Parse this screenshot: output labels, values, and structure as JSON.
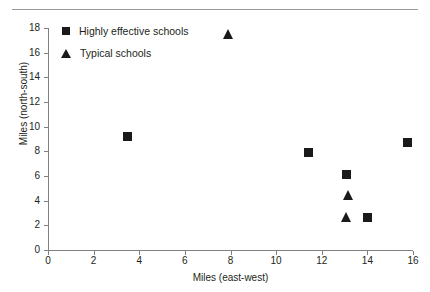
{
  "chart_data": {
    "type": "scatter",
    "title": "",
    "xlabel": "Miles (east-west)",
    "ylabel": "Miles (north-south)",
    "xlim": [
      0,
      16
    ],
    "ylim": [
      0,
      18
    ],
    "xticks": [
      0,
      2,
      4,
      6,
      8,
      10,
      12,
      14,
      16
    ],
    "yticks": [
      0,
      2,
      4,
      6,
      8,
      10,
      12,
      14,
      16,
      18
    ],
    "grid": false,
    "legend_position": "top-left",
    "series": [
      {
        "name": "Highly effective schools",
        "marker": "square",
        "color": "#1a1a1a",
        "points": [
          {
            "x": 3.5,
            "y": 9.2
          },
          {
            "x": 11.4,
            "y": 7.9
          },
          {
            "x": 15.75,
            "y": 8.7
          },
          {
            "x": 13.1,
            "y": 6.15
          },
          {
            "x": 14.0,
            "y": 2.65
          }
        ]
      },
      {
        "name": "Typical schools",
        "marker": "triangle",
        "color": "#1a1a1a",
        "points": [
          {
            "x": 7.9,
            "y": 17.5
          },
          {
            "x": 13.15,
            "y": 4.45
          },
          {
            "x": 13.1,
            "y": 2.65
          }
        ]
      }
    ]
  },
  "legend": {
    "items": [
      {
        "label": "Highly effective schools",
        "marker": "square"
      },
      {
        "label": "Typical schools",
        "marker": "triangle"
      }
    ]
  },
  "axes": {
    "x_title": "Miles (east-west)",
    "y_title": "Miles (north-south)",
    "x_tick_labels": [
      "0",
      "2",
      "4",
      "6",
      "8",
      "10",
      "12",
      "14",
      "16"
    ],
    "y_tick_labels": [
      "0",
      "2",
      "4",
      "6",
      "8",
      "10",
      "12",
      "14",
      "16",
      "18"
    ]
  },
  "colors": {
    "marker": "#1a1a1a",
    "axis": "#808080",
    "text": "#231f20",
    "rule": "#9a9a9a"
  }
}
